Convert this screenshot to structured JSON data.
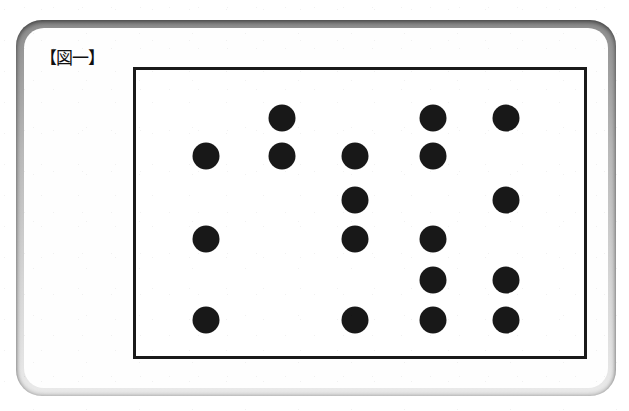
{
  "figure": {
    "label": "【図一】",
    "label_plain": "Figure 1",
    "alt": "Scanned book page plate showing a grid of filled black circles"
  },
  "colors": {
    "dot": "#181818",
    "frame_border": "#1a1a1a",
    "plate_background": "#fefefe",
    "page_background": "#ffffff",
    "card_edge_dark": "#8d8d8d",
    "card_edge_light": "#eaeaea"
  },
  "frame": {
    "left": 133,
    "top": 67,
    "width": 454,
    "height": 292,
    "border_width": 3
  },
  "chart_data": {
    "type": "scatter",
    "title": "【図一】",
    "xlabel": "",
    "ylabel": "",
    "grid": false,
    "legend": null,
    "marker": "filled-circle",
    "marker_diameter_px": 27,
    "columns": 5,
    "rows": 6,
    "column_x": [
      203,
      279,
      352,
      430,
      503
    ],
    "row_y": [
      115,
      153,
      197,
      236,
      277,
      317
    ],
    "occupancy_matrix": [
      [
        0,
        1,
        0,
        1,
        1
      ],
      [
        1,
        1,
        1,
        1,
        0
      ],
      [
        0,
        0,
        1,
        0,
        1
      ],
      [
        1,
        0,
        1,
        1,
        0
      ],
      [
        0,
        0,
        0,
        1,
        1
      ],
      [
        1,
        0,
        1,
        1,
        1
      ]
    ],
    "points": [
      {
        "col": 2,
        "row": 1,
        "x": 279,
        "y": 115
      },
      {
        "col": 4,
        "row": 1,
        "x": 430,
        "y": 115
      },
      {
        "col": 5,
        "row": 1,
        "x": 503,
        "y": 115
      },
      {
        "col": 1,
        "row": 2,
        "x": 203,
        "y": 153
      },
      {
        "col": 2,
        "row": 2,
        "x": 279,
        "y": 153
      },
      {
        "col": 3,
        "row": 2,
        "x": 352,
        "y": 153
      },
      {
        "col": 4,
        "row": 2,
        "x": 430,
        "y": 153
      },
      {
        "col": 3,
        "row": 3,
        "x": 352,
        "y": 197
      },
      {
        "col": 5,
        "row": 3,
        "x": 503,
        "y": 197
      },
      {
        "col": 1,
        "row": 4,
        "x": 203,
        "y": 236
      },
      {
        "col": 3,
        "row": 4,
        "x": 352,
        "y": 236
      },
      {
        "col": 4,
        "row": 4,
        "x": 430,
        "y": 236
      },
      {
        "col": 4,
        "row": 5,
        "x": 430,
        "y": 277
      },
      {
        "col": 5,
        "row": 5,
        "x": 503,
        "y": 277
      },
      {
        "col": 1,
        "row": 6,
        "x": 203,
        "y": 317
      },
      {
        "col": 3,
        "row": 6,
        "x": 352,
        "y": 317
      },
      {
        "col": 4,
        "row": 6,
        "x": 430,
        "y": 317
      },
      {
        "col": 5,
        "row": 6,
        "x": 503,
        "y": 317
      }
    ],
    "total_dots": 18,
    "dots_per_row": [
      3,
      4,
      2,
      3,
      2,
      4
    ],
    "dots_per_column": [
      3,
      2,
      4,
      5,
      4
    ]
  }
}
